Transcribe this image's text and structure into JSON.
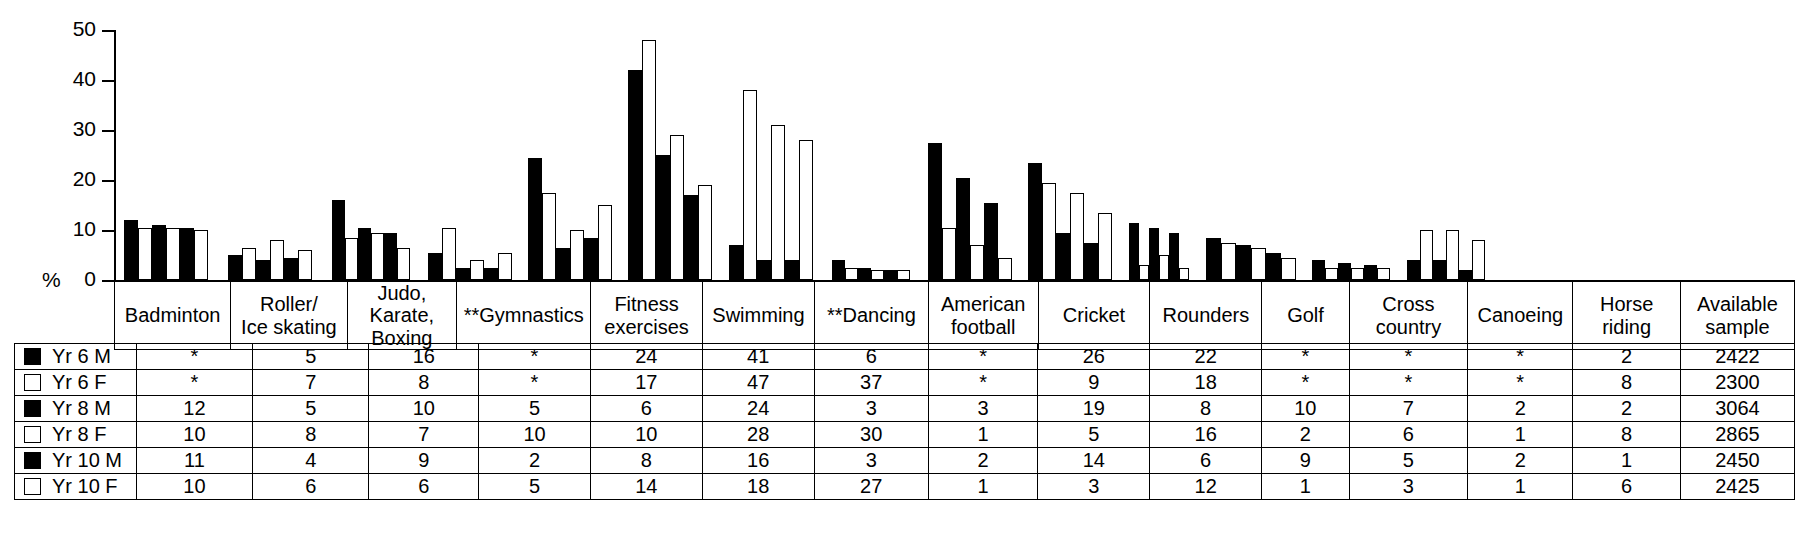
{
  "axis": {
    "y_label": "%",
    "y_ticks": [
      "50",
      "40",
      "30",
      "20",
      "10",
      "0"
    ],
    "y_max": 50
  },
  "legend": [
    {
      "label": "Yr 6 M",
      "swatch": "filled-square-icon"
    },
    {
      "label": "Yr 6 F",
      "swatch": "open-square-icon"
    },
    {
      "label": "Yr 8 M",
      "swatch": "filled-square-icon"
    },
    {
      "label": "Yr 8 F",
      "swatch": "open-square-icon"
    },
    {
      "label": "Yr 10 M",
      "swatch": "filled-square-icon"
    },
    {
      "label": "Yr 10 F",
      "swatch": "open-square-icon"
    }
  ],
  "table": {
    "columns": [
      "Badminton",
      "Roller/\nIce skating",
      "Judo,\nKarate,\nBoxing",
      "**Gymnastics",
      "Fitness\nexercises",
      "Swimming",
      "**Dancing",
      "American\nfootball",
      "Cricket",
      "Rounders",
      "Golf",
      "Cross country",
      "Canoeing",
      "Horse riding",
      "Available\nsample"
    ],
    "rows": [
      {
        "label": "Yr 6 M",
        "values": [
          "*",
          "5",
          "16",
          "*",
          "24",
          "41",
          "6",
          "*",
          "26",
          "22",
          "*",
          "*",
          "*",
          "2",
          "2422"
        ]
      },
      {
        "label": "Yr 6 F",
        "values": [
          "*",
          "7",
          "8",
          "*",
          "17",
          "47",
          "37",
          "*",
          "9",
          "18",
          "*",
          "*",
          "*",
          "8",
          "2300"
        ]
      },
      {
        "label": "Yr 8 M",
        "values": [
          "12",
          "5",
          "10",
          "5",
          "6",
          "24",
          "3",
          "3",
          "19",
          "8",
          "10",
          "7",
          "2",
          "2",
          "3064"
        ]
      },
      {
        "label": "Yr 8 F",
        "values": [
          "10",
          "8",
          "7",
          "10",
          "10",
          "28",
          "30",
          "1",
          "5",
          "16",
          "2",
          "6",
          "1",
          "8",
          "2865"
        ]
      },
      {
        "label": "Yr 10 M",
        "values": [
          "11",
          "4",
          "9",
          "2",
          "8",
          "16",
          "3",
          "2",
          "14",
          "6",
          "9",
          "5",
          "2",
          "1",
          "2450"
        ]
      },
      {
        "label": "Yr 10 F",
        "values": [
          "10",
          "6",
          "6",
          "5",
          "14",
          "18",
          "27",
          "1",
          "3",
          "12",
          "1",
          "3",
          "1",
          "6",
          "2425"
        ]
      }
    ]
  },
  "chart_data": {
    "type": "bar",
    "title": "",
    "xlabel": "",
    "ylabel": "%",
    "ylim": [
      0,
      50
    ],
    "grid": false,
    "legend_position": "table-left",
    "categories": [
      "Badminton",
      "Roller/Ice skating",
      "Judo, Karate, Boxing",
      "**Gymnastics",
      "Fitness exercises",
      "Swimming",
      "**Dancing",
      "American football",
      "Cricket",
      "Rounders",
      "Golf",
      "Cross country",
      "Canoeing",
      "Horse riding"
    ],
    "series": [
      {
        "name": "Yr 6 M",
        "fill": "black",
        "values": [
          12,
          5,
          16,
          5.5,
          24.5,
          42,
          7,
          4,
          27.5,
          23.5,
          11.5,
          8.5,
          4,
          4
        ]
      },
      {
        "name": "Yr 6 F",
        "fill": "white",
        "values": [
          10.5,
          6.5,
          8.5,
          10.5,
          17.5,
          48,
          38,
          2.5,
          10.5,
          19.5,
          3,
          7.5,
          2.5,
          10
        ]
      },
      {
        "name": "Yr 8 M",
        "fill": "black",
        "values": [
          11,
          4,
          10.5,
          2.5,
          6.5,
          25,
          4,
          2.5,
          20.5,
          9.5,
          10.5,
          7,
          3.5,
          4
        ]
      },
      {
        "name": "Yr 8 F",
        "fill": "white",
        "values": [
          10.5,
          8,
          9.5,
          4,
          10,
          29,
          31,
          2,
          7,
          17.5,
          5,
          6.5,
          2.5,
          10
        ]
      },
      {
        "name": "Yr 10 M",
        "fill": "black",
        "values": [
          10.5,
          4.5,
          9.5,
          2.5,
          8.5,
          17,
          4,
          2,
          15.5,
          7.5,
          9.5,
          5.5,
          3,
          2
        ]
      },
      {
        "name": "Yr 10 F",
        "fill": "white",
        "values": [
          10,
          6,
          6.5,
          5.5,
          15,
          19,
          28,
          2,
          4.5,
          13.5,
          2.5,
          4.5,
          2.5,
          8
        ]
      }
    ]
  }
}
